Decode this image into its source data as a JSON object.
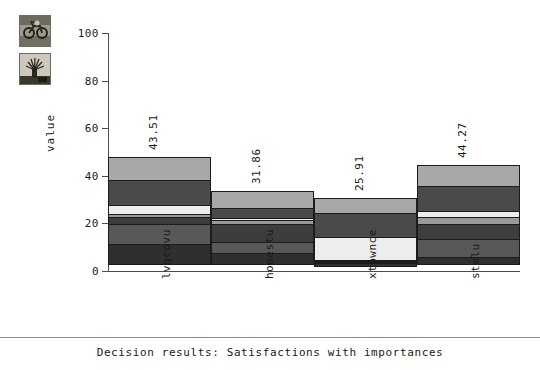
{
  "thumbnails": [
    {
      "name": "motorcycle-photo-thumbnail",
      "alt": "motorcycle photo"
    },
    {
      "name": "tree-photo-thumbnail",
      "alt": "tree photo"
    }
  ],
  "footer": {
    "caption": "Decision results: Satisfactions with importances"
  },
  "chart_data": {
    "type": "bar",
    "title": "",
    "subtitle": "",
    "xlabel": "",
    "ylabel": "value",
    "ylim": [
      0,
      100
    ],
    "yticks": [
      0,
      20,
      40,
      60,
      80,
      100
    ],
    "ytick_labels": [
      "0",
      "20",
      "40",
      "60",
      "80",
      "100"
    ],
    "grid": false,
    "legend": "none",
    "stacked": true,
    "categories": [
      "lvgcovu",
      "homestu",
      "xtownce",
      "stalu"
    ],
    "values": [
      43.51,
      31.86,
      25.91,
      44.27
    ],
    "value_labels": [
      "43.51",
      "31.86",
      "25.91",
      "44.27"
    ],
    "bar_tops": [
      48.0,
      33.5,
      30.5,
      44.5
    ],
    "series": [
      {
        "name": "segment-1",
        "color": "#2f2f2f",
        "values": [
          9.0,
          5.0,
          1.5,
          3.5
        ]
      },
      {
        "name": "segment-2",
        "color": "#585858",
        "values": [
          8.5,
          5.0,
          0.5,
          8.0
        ]
      },
      {
        "name": "segment-3",
        "color": "#3d3d3d",
        "values": [
          3.5,
          8.0,
          0.5,
          6.5
        ]
      },
      {
        "name": "segment-4",
        "color": "#9a9a9a",
        "values": [
          1.5,
          2.0,
          1.0,
          3.5
        ]
      },
      {
        "name": "segment-5",
        "color": "#ededed",
        "values": [
          4.5,
          1.5,
          10.0,
          3.0
        ]
      },
      {
        "name": "segment-6",
        "color": "#4a4a4a",
        "values": [
          11.0,
          4.5,
          10.5,
          11.0
        ]
      },
      {
        "name": "segment-7",
        "color": "#a8a8a8",
        "values": [
          10.0,
          7.5,
          6.5,
          9.0
        ]
      }
    ]
  }
}
